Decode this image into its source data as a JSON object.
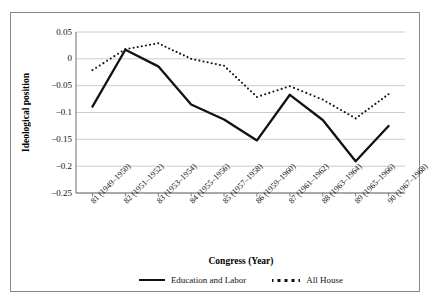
{
  "chart_data": {
    "type": "line",
    "title": "",
    "xlabel": "Congress (Year)",
    "ylabel": "Ideological position",
    "categories": [
      "81 (1949–1950)",
      "82 (1951–1952)",
      "83 (1953–1954)",
      "84 (1955–1956)",
      "85 (1957–1958)",
      "86 (1959–1960)",
      "87 (1961–1962)",
      "88 (1963–1964)",
      "89 (1965–1966)",
      "90 (1967–1968)"
    ],
    "yticks": [
      "0.05",
      "0",
      "−0.05",
      "−0.1",
      "−0.15",
      "−0.2",
      "−0.25"
    ],
    "ytick_values": [
      0.05,
      0,
      -0.05,
      -0.1,
      -0.15,
      -0.2,
      -0.25
    ],
    "ylim": [
      -0.25,
      0.05
    ],
    "grid": "horizontal",
    "legend_position": "bottom",
    "series": [
      {
        "name": "Education and Labor",
        "style": "solid",
        "color": "#111111",
        "values": [
          -0.089,
          0.017,
          -0.014,
          -0.085,
          -0.113,
          -0.152,
          -0.067,
          -0.114,
          -0.191,
          -0.125
        ]
      },
      {
        "name": "All House",
        "style": "dotted",
        "color": "#111111",
        "values": [
          -0.021,
          0.018,
          0.029,
          0.0,
          -0.013,
          -0.071,
          -0.051,
          -0.076,
          -0.111,
          -0.066
        ]
      }
    ]
  },
  "legend": {
    "items": [
      {
        "label": "Education and Labor",
        "marker": "solid-line-swatch"
      },
      {
        "label": "All House",
        "marker": "dotted-line-swatch"
      }
    ]
  }
}
